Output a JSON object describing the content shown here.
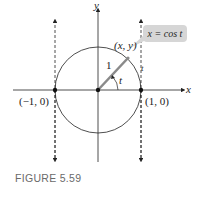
{
  "figure": {
    "caption": "FIGURE 5.59",
    "axes": {
      "x_label": "x",
      "y_label": "y"
    },
    "points": {
      "left": "(−1, 0)",
      "right": "(1, 0)",
      "on_circle": "(x, y)"
    },
    "radius_label": "1",
    "angle_label": "t",
    "dashed_line_label": "t",
    "callout": "x = cos t",
    "colors": {
      "radius": "#8a8a8a",
      "callout_bg": "#d6d6d6",
      "caption": "#6a6a6a",
      "line": "#222222"
    }
  }
}
